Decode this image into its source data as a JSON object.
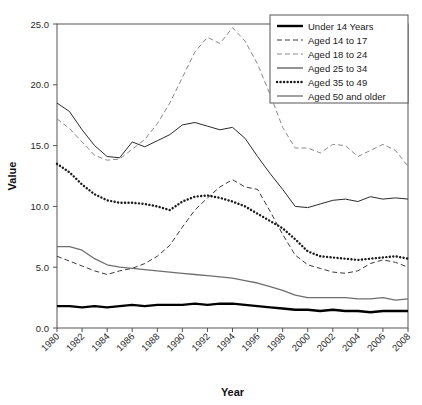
{
  "chart_data": {
    "type": "line",
    "title": "",
    "xlabel": "Year",
    "ylabel": "Value",
    "xlim": [
      1980,
      2008
    ],
    "ylim": [
      0.0,
      25.0
    ],
    "yticks": [
      "0.0",
      "5.0",
      "10.0",
      "15.0",
      "20.0",
      "25.0"
    ],
    "ytick_values": [
      0.0,
      5.0,
      10.0,
      15.0,
      20.0,
      25.0
    ],
    "xticks": [
      "1980",
      "1982",
      "1984",
      "1986",
      "1988",
      "1990",
      "1992",
      "1994",
      "1996",
      "1998",
      "2000",
      "2002",
      "2004",
      "2006",
      "2008"
    ],
    "xtick_values": [
      1980,
      1982,
      1984,
      1986,
      1988,
      1990,
      1992,
      1994,
      1996,
      1998,
      2000,
      2002,
      2004,
      2006,
      2008
    ],
    "grid": false,
    "legend_position": "top-right",
    "x": [
      1980,
      1981,
      1982,
      1983,
      1984,
      1985,
      1986,
      1987,
      1988,
      1989,
      1990,
      1991,
      1992,
      1993,
      1994,
      1995,
      1996,
      1997,
      1998,
      1999,
      2000,
      2001,
      2002,
      2003,
      2004,
      2005,
      2006,
      2007,
      2008
    ],
    "series": [
      {
        "name": "Under 14 Years",
        "style": "solid-thick",
        "color": "#000000",
        "values": [
          1.8,
          1.8,
          1.7,
          1.8,
          1.7,
          1.8,
          1.9,
          1.8,
          1.9,
          1.9,
          1.9,
          2.0,
          1.9,
          2.0,
          2.0,
          1.9,
          1.8,
          1.7,
          1.6,
          1.5,
          1.5,
          1.4,
          1.5,
          1.4,
          1.4,
          1.3,
          1.4,
          1.4,
          1.4
        ]
      },
      {
        "name": "Aged 14 to 17",
        "style": "dashed",
        "color": "#3a3a3a",
        "values": [
          5.9,
          5.5,
          5.1,
          4.7,
          4.4,
          4.7,
          4.9,
          5.3,
          5.9,
          6.8,
          8.3,
          9.7,
          10.7,
          11.6,
          12.2,
          11.6,
          11.4,
          9.6,
          7.7,
          6.0,
          5.2,
          4.9,
          4.6,
          4.5,
          4.7,
          5.3,
          5.6,
          5.4,
          5.0
        ]
      },
      {
        "name": "Aged 18 to 24",
        "style": "dashed-light",
        "color": "#8a8a8a",
        "values": [
          17.2,
          16.4,
          15.3,
          14.2,
          13.8,
          13.9,
          14.7,
          15.5,
          16.8,
          18.5,
          20.6,
          22.7,
          23.9,
          23.4,
          24.7,
          23.6,
          21.7,
          19.2,
          16.5,
          14.8,
          14.8,
          14.4,
          15.1,
          15.0,
          14.1,
          14.6,
          15.1,
          14.6,
          13.3
        ]
      },
      {
        "name": "Aged 25 to 34",
        "style": "solid",
        "color": "#2a2a2a",
        "values": [
          18.5,
          17.8,
          16.3,
          15.0,
          14.1,
          14.0,
          15.3,
          14.9,
          15.4,
          15.9,
          16.7,
          16.9,
          16.6,
          16.3,
          16.5,
          15.6,
          14.1,
          12.7,
          11.4,
          10.0,
          9.9,
          10.2,
          10.5,
          10.6,
          10.4,
          10.8,
          10.6,
          10.7,
          10.6
        ]
      },
      {
        "name": "Aged 35 to 49",
        "style": "dotted",
        "color": "#1a1a1a",
        "values": [
          13.5,
          12.8,
          11.8,
          11.0,
          10.5,
          10.3,
          10.3,
          10.2,
          10.0,
          9.7,
          10.4,
          10.8,
          10.9,
          10.7,
          10.4,
          10.0,
          9.4,
          8.8,
          8.2,
          7.3,
          6.3,
          5.9,
          5.8,
          5.7,
          5.6,
          5.7,
          5.8,
          5.9,
          5.7
        ]
      },
      {
        "name": "Aged 50 and older",
        "style": "solid-gray",
        "color": "#6e6e6e",
        "values": [
          6.7,
          6.7,
          6.4,
          5.7,
          5.2,
          5.0,
          4.9,
          4.8,
          4.7,
          4.6,
          4.5,
          4.4,
          4.3,
          4.2,
          4.1,
          3.9,
          3.7,
          3.4,
          3.1,
          2.7,
          2.5,
          2.5,
          2.5,
          2.5,
          2.4,
          2.4,
          2.5,
          2.3,
          2.4
        ]
      }
    ]
  }
}
